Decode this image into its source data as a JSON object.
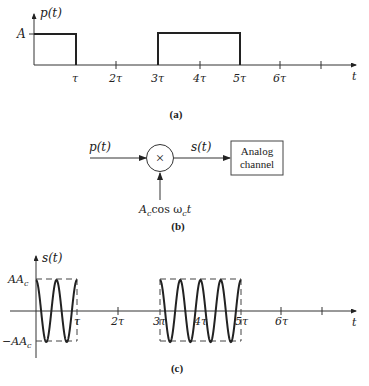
{
  "panel_a": {
    "caption": "(a)",
    "y_label": "p(t)",
    "x_label": "t",
    "amplitude_label": "A",
    "ticks": [
      "τ",
      "2τ",
      "3τ",
      "4τ",
      "5τ",
      "6τ"
    ]
  },
  "panel_b": {
    "caption": "(b)",
    "input_label": "p(t)",
    "output_label": "s(t)",
    "multiplier_symbol": "×",
    "carrier_label_main": "A",
    "carrier_label_sub": "c",
    "carrier_label_mid": "cos ω",
    "carrier_label_sub2": "c",
    "carrier_label_end": "t",
    "channel_line1": "Analog",
    "channel_line2": "channel"
  },
  "panel_c": {
    "caption": "(c)",
    "y_label": "s(t)",
    "x_label": "t",
    "pos_amp_main": "AA",
    "pos_amp_sub": "c",
    "neg_amp_main": "−AA",
    "neg_amp_sub": "c",
    "ticks": [
      "τ",
      "2τ",
      "3τ",
      "4τ",
      "5τ",
      "6τ"
    ]
  },
  "chart_data": [
    {
      "type": "line",
      "title": "(a) Baseband pulse signal p(t)",
      "xlabel": "t",
      "ylabel": "p(t)",
      "x_ticks": [
        "τ",
        "2τ",
        "3τ",
        "4τ",
        "5τ",
        "6τ"
      ],
      "segments": [
        {
          "from": "0",
          "to": "τ",
          "value": "A"
        },
        {
          "from": "τ",
          "to": "3τ",
          "value": "0"
        },
        {
          "from": "3τ",
          "to": "5τ",
          "value": "A"
        },
        {
          "from": "5τ",
          "to": "7τ",
          "value": "0"
        }
      ]
    },
    {
      "type": "line",
      "title": "(c) Modulated signal s(t) = p(t)·A_c cos ω_c t",
      "xlabel": "t",
      "ylabel": "s(t)",
      "y_levels": [
        "AA_c",
        "−AA_c"
      ],
      "x_ticks": [
        "τ",
        "2τ",
        "3τ",
        "4τ",
        "5τ",
        "6τ"
      ],
      "bursts": [
        {
          "from": "0",
          "to": "τ",
          "cycles": 2
        },
        {
          "from": "3τ",
          "to": "5τ",
          "cycles": 4
        }
      ]
    }
  ]
}
